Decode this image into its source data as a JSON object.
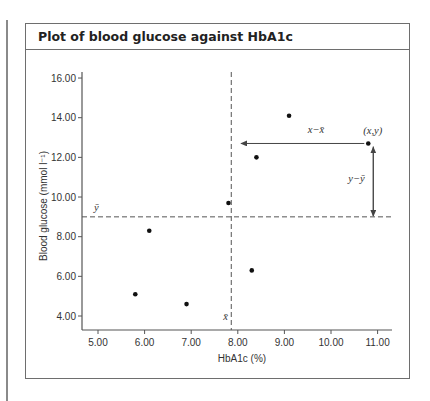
{
  "panel": {
    "title": "Plot of blood glucose against HbA1c"
  },
  "chart_data": {
    "type": "scatter",
    "title": "Plot of blood glucose against HbA1c",
    "xlabel": "HbA1c (%)",
    "ylabel": "Blood glucose (mmol l⁻¹)",
    "xlim": [
      4.7,
      11.3
    ],
    "ylim": [
      3.3,
      16.5
    ],
    "x_ticks": [
      "5.00",
      "6.00",
      "7.00",
      "8.00",
      "9.00",
      "10.00",
      "11.00"
    ],
    "y_ticks": [
      "4.00",
      "6.00",
      "8.00",
      "10.00",
      "12.00",
      "14.00",
      "16.00"
    ],
    "grid": false,
    "points": [
      {
        "x": 5.8,
        "y": 5.1
      },
      {
        "x": 6.1,
        "y": 8.3
      },
      {
        "x": 6.9,
        "y": 4.6
      },
      {
        "x": 7.8,
        "y": 9.7
      },
      {
        "x": 8.3,
        "y": 6.3
      },
      {
        "x": 8.4,
        "y": 12.0
      },
      {
        "x": 9.1,
        "y": 14.1
      },
      {
        "x": 10.8,
        "y": 12.7
      }
    ],
    "mean_x": 7.86,
    "mean_y": 9.0,
    "annotations": {
      "mean_x_label": "x̄",
      "mean_y_label": "ȳ",
      "point_label": "(x,y)",
      "x_deviation_label": "x−x̄",
      "y_deviation_label": "y−ȳ"
    },
    "colors": {
      "points": "#111111",
      "lines": "#555555",
      "frame": "#6e6e6e"
    }
  }
}
